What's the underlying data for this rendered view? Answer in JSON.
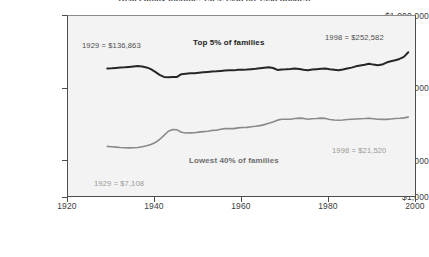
{
  "chart_data": {
    "type": "line",
    "title": "Real Family Income, 1929-1998 (in 1998 dollars)",
    "xlabel": "",
    "ylabel": "",
    "yscale": "log",
    "ylim": [
      1000,
      1000000
    ],
    "xlim": [
      1920,
      2000
    ],
    "grid": false,
    "legend_position": "inline-annotation",
    "background_color": "#f3f3f3",
    "ytick_labels": [
      "$1,000,000",
      "$100,000",
      "$10,000",
      "$1,000"
    ],
    "ytick_values": [
      1000000,
      100000,
      10000,
      1000
    ],
    "xtick_labels": [
      "1920",
      "1940",
      "1960",
      "1980",
      "2000"
    ],
    "xtick_values": [
      1920,
      1940,
      1960,
      1980,
      2000
    ],
    "series": [
      {
        "name": "Top 5% of families",
        "color": "#262626",
        "line_width": 2.0,
        "label_text": "Top 5% of families",
        "start_annotation": "1929  =  $136,863",
        "end_annotation": "1998  =  $252,582",
        "x": [
          1929,
          1930,
          1931,
          1932,
          1933,
          1934,
          1935,
          1936,
          1937,
          1938,
          1939,
          1940,
          1941,
          1942,
          1943,
          1944,
          1945,
          1946,
          1947,
          1948,
          1949,
          1950,
          1951,
          1952,
          1953,
          1954,
          1955,
          1956,
          1957,
          1958,
          1959,
          1960,
          1961,
          1962,
          1963,
          1964,
          1965,
          1966,
          1967,
          1968,
          1969,
          1970,
          1971,
          1972,
          1973,
          1974,
          1975,
          1976,
          1977,
          1978,
          1979,
          1980,
          1981,
          1982,
          1983,
          1984,
          1985,
          1986,
          1987,
          1988,
          1989,
          1990,
          1991,
          1992,
          1993,
          1994,
          1995,
          1996,
          1997,
          1998
        ],
        "y": [
          136863,
          137800,
          139500,
          141000,
          142500,
          144500,
          146800,
          149500,
          147000,
          142000,
          133000,
          120000,
          107000,
          99000,
          98200,
          98500,
          99000,
          110000,
          112000,
          113500,
          114000,
          116500,
          118000,
          119500,
          121500,
          122500,
          124500,
          126500,
          127500,
          127000,
          129500,
          130500,
          131000,
          133000,
          134500,
          137500,
          140500,
          142500,
          139000,
          129000,
          131500,
          132000,
          133500,
          136500,
          134000,
          130500,
          128000,
          131000,
          133000,
          135500,
          136000,
          132500,
          130000,
          128000,
          131500,
          136500,
          141000,
          148000,
          153000,
          157500,
          163000,
          158000,
          154000,
          158000,
          171000,
          179000,
          186000,
          196000,
          212000,
          252582
        ]
      },
      {
        "name": "Lowest 40% of families",
        "color": "#8a8a8a",
        "line_width": 1.6,
        "label_text": "Lowest 40% of families",
        "start_annotation": "1929  =  $7,108",
        "end_annotation": "1998  =  $21,520",
        "x": [
          1929,
          1930,
          1931,
          1932,
          1933,
          1934,
          1935,
          1936,
          1937,
          1938,
          1939,
          1940,
          1941,
          1942,
          1943,
          1944,
          1945,
          1946,
          1947,
          1948,
          1949,
          1950,
          1951,
          1952,
          1953,
          1954,
          1955,
          1956,
          1957,
          1958,
          1959,
          1960,
          1961,
          1962,
          1963,
          1964,
          1965,
          1966,
          1967,
          1968,
          1969,
          1970,
          1971,
          1972,
          1973,
          1974,
          1975,
          1976,
          1977,
          1978,
          1979,
          1980,
          1981,
          1982,
          1983,
          1984,
          1985,
          1986,
          1987,
          1988,
          1989,
          1990,
          1991,
          1992,
          1993,
          1994,
          1995,
          1996,
          1997,
          1998
        ],
        "y": [
          7108,
          7000,
          6900,
          6800,
          6750,
          6700,
          6720,
          6780,
          7000,
          7250,
          7650,
          8200,
          9200,
          10800,
          12600,
          13400,
          13300,
          12100,
          11800,
          11850,
          11900,
          12200,
          12400,
          12600,
          13000,
          13100,
          13600,
          13900,
          14000,
          13900,
          14300,
          14500,
          14600,
          14950,
          15200,
          15600,
          16200,
          17100,
          17900,
          19200,
          19900,
          19850,
          19900,
          20400,
          20700,
          20500,
          19900,
          20200,
          20400,
          20700,
          20500,
          19700,
          19300,
          19100,
          19300,
          19700,
          19900,
          20100,
          20300,
          20400,
          20600,
          20300,
          19900,
          19800,
          19800,
          20100,
          20400,
          20600,
          20900,
          21520
        ]
      }
    ]
  },
  "annotations": {
    "top_start": "1929  =  $136,863",
    "top_end": "1998  =  $252,582",
    "bottom_start": "1929  =  $7,108",
    "bottom_end": "1998  =  $21,520",
    "top_series_label": "Top 5% of families",
    "bottom_series_label": "Lowest 40% of families"
  }
}
